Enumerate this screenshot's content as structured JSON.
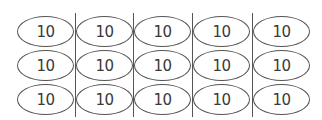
{
  "diagram": {
    "type": "ellipse-grid",
    "rows": 3,
    "cols": 5,
    "cells": [
      [
        "10",
        "10",
        "10",
        "10",
        "10"
      ],
      [
        "10",
        "10",
        "10",
        "10",
        "10"
      ],
      [
        "10",
        "10",
        "10",
        "10",
        "10"
      ]
    ],
    "divider_count": 4,
    "colors": {
      "stroke": "#555555",
      "text": "#3a3a3a",
      "background": "#ffffff"
    }
  }
}
